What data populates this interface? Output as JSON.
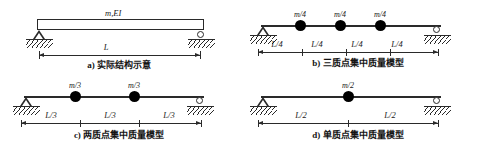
{
  "figure": {
    "panels": [
      {
        "key": "a",
        "caption": "a) 实际结构示意",
        "beam_label": "m,EI",
        "supports": [
          "pin",
          "roller"
        ],
        "masses": [],
        "dimensions": [
          {
            "label": "L"
          }
        ]
      },
      {
        "key": "b",
        "caption": "b) 三质点集中质量模型",
        "beam_label": "",
        "supports": [
          "pin",
          "roller"
        ],
        "masses": [
          {
            "label": "m/4"
          },
          {
            "label": "m/4"
          },
          {
            "label": "m/4"
          }
        ],
        "dimensions": [
          {
            "label": "L/4"
          },
          {
            "label": "L/4"
          },
          {
            "label": "L/4"
          },
          {
            "label": "L/4"
          }
        ]
      },
      {
        "key": "c",
        "caption": "c) 两质点集中质量模型",
        "beam_label": "",
        "supports": [
          "pin",
          "roller"
        ],
        "masses": [
          {
            "label": "m/3"
          },
          {
            "label": "m/3"
          }
        ],
        "dimensions": [
          {
            "label": "L/3"
          },
          {
            "label": "L/3"
          },
          {
            "label": "L/3"
          }
        ]
      },
      {
        "key": "d",
        "caption": "d) 单质点集中质量模型",
        "beam_label": "",
        "supports": [
          "pin",
          "roller"
        ],
        "masses": [
          {
            "label": "m/2"
          }
        ],
        "dimensions": [
          {
            "label": "L/2"
          },
          {
            "label": "L/2"
          }
        ]
      }
    ]
  }
}
